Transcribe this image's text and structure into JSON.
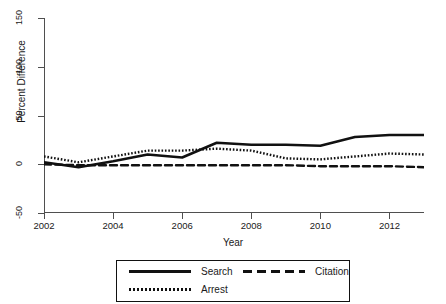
{
  "chart_data": {
    "type": "line",
    "title": "",
    "xlabel": "Year",
    "ylabel": "Percent Difference",
    "xlim": [
      2002,
      2013
    ],
    "ylim": [
      -50,
      150
    ],
    "xticks": [
      "2002",
      "2004",
      "2006",
      "2008",
      "2010",
      "2012"
    ],
    "xtick_values": [
      2002,
      2004,
      2006,
      2008,
      2010,
      2012
    ],
    "yticks": [
      "150",
      "100",
      "50",
      "0",
      "-50"
    ],
    "ytick_values": [
      150,
      100,
      50,
      0,
      -50
    ],
    "grid": false,
    "legend_position": "bottom",
    "x": [
      2002,
      2003,
      2004,
      2005,
      2006,
      2007,
      2008,
      2009,
      2010,
      2011,
      2012,
      2013
    ],
    "series": [
      {
        "name": "Search",
        "style": "solid",
        "color": "#111111",
        "values": [
          2,
          -3,
          3,
          10,
          7,
          22,
          20,
          20,
          19,
          28,
          30,
          30
        ]
      },
      {
        "name": "Citation",
        "style": "dashed",
        "color": "#111111",
        "values": [
          0,
          -1,
          -1,
          -1,
          -1,
          -1,
          -1,
          -1,
          -2,
          -2,
          -2,
          -3
        ]
      },
      {
        "name": "Arrest",
        "style": "dotted",
        "color": "#111111",
        "values": [
          8,
          2,
          8,
          14,
          14,
          16,
          14,
          6,
          5,
          8,
          11,
          10
        ]
      }
    ]
  },
  "axes": {
    "y_title": "Percent Difference",
    "x_title": "Year",
    "y_tick_labels": [
      "150",
      "100",
      "50",
      "0",
      "-50"
    ],
    "x_tick_labels": [
      "2002",
      "2004",
      "2006",
      "2008",
      "2010",
      "2012"
    ]
  },
  "legend": {
    "entries": [
      {
        "label": "Search",
        "key": "solid-line-key"
      },
      {
        "label": "Citation",
        "key": "dashed-line-key"
      },
      {
        "label": "Arrest",
        "key": "dotted-line-key"
      }
    ]
  }
}
